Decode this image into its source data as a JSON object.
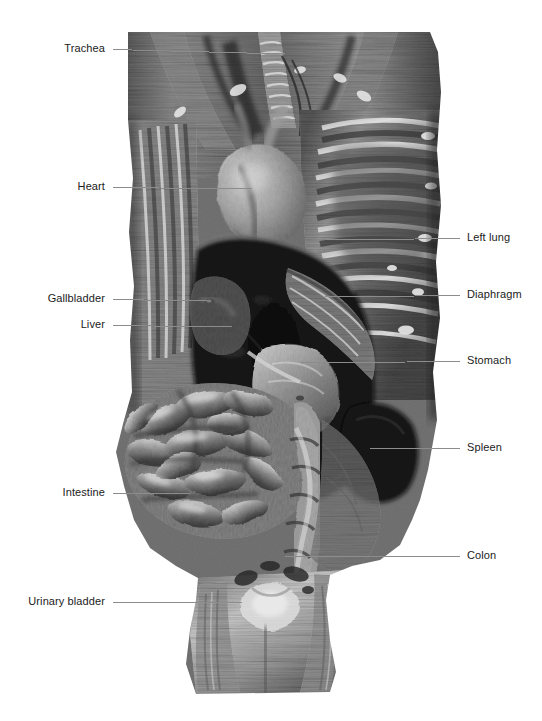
{
  "figure": {
    "background_color": "#ffffff",
    "leader_line_color": "#8c8c8c",
    "label_text_color": "#1b1b1b",
    "width": 542,
    "height": 721
  },
  "specimen": {
    "name": "ventral dissection photograph",
    "rendering": "grayscale",
    "bounds": {
      "x": 128,
      "y": 32,
      "width": 312,
      "height": 663
    }
  },
  "labels": {
    "left": [
      {
        "text": "Trachea",
        "label_x": 105,
        "y": 48,
        "line_from": 113,
        "line_to": 285,
        "tip_y": 54
      },
      {
        "text": "Heart",
        "label_x": 105,
        "y": 186,
        "line_from": 113,
        "line_to": 252,
        "tip_y": 189
      },
      {
        "text": "Gallbladder",
        "label_x": 105,
        "y": 298,
        "line_from": 113,
        "line_to": 207,
        "tip_y": 301
      },
      {
        "text": "Liver",
        "label_x": 105,
        "y": 324,
        "line_from": 113,
        "line_to": 232,
        "tip_y": 327
      },
      {
        "text": "Intestine",
        "label_x": 105,
        "y": 492,
        "line_from": 113,
        "line_to": 190,
        "tip_y": 494
      },
      {
        "text": "Urinary bladder",
        "label_x": 105,
        "y": 601,
        "line_from": 113,
        "line_to": 242,
        "tip_y": 603
      }
    ],
    "right": [
      {
        "text": "Left lung",
        "label_x": 467,
        "y": 237,
        "line_from": 325,
        "line_to": 460,
        "tip_y": 240
      },
      {
        "text": "Diaphragm",
        "label_x": 467,
        "y": 294,
        "line_from": 325,
        "line_to": 460,
        "tip_y": 297
      },
      {
        "text": "Stomach",
        "label_x": 467,
        "y": 360,
        "line_from": 300,
        "line_to": 460,
        "tip_y": 363
      },
      {
        "text": "Spleen",
        "label_x": 467,
        "y": 447,
        "line_from": 370,
        "line_to": 460,
        "tip_y": 449
      },
      {
        "text": "Colon",
        "label_x": 467,
        "y": 555,
        "line_from": 285,
        "line_to": 460,
        "tip_y": 557
      }
    ]
  }
}
